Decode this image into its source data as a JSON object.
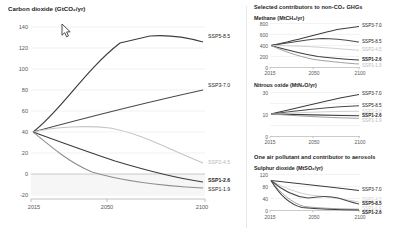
{
  "panels": {
    "main_title": "Carbon dioxide (GtCO₂/yr)",
    "right_header_1": "Selected contributors to non-CO₂ GHGs",
    "right_header_2": "One air pollutant and contributor to aerosols",
    "methane_title": "Methane (MtCH₄/yr)",
    "nitrous_title": "Nitrous oxide (MtN₂O/yr)",
    "sulphur_title": "Sulphur dioxide (MtSO₂/yr)"
  },
  "series_names": {
    "ssp5": "SSP5-8.5",
    "ssp3": "SSP3-7.0",
    "ssp2": "SSP2-4.5",
    "ssp126": "SSP1-2.6",
    "ssp119": "SSP1-1.9"
  },
  "colors": {
    "dark": "#3c3c3b",
    "mid": "#6f6f6e",
    "light": "#b9b9ba",
    "lighter": "#d2d2d3",
    "axis": "#9d9d9c",
    "grid": "#ebebeb",
    "text": "#1d1d1b",
    "tick_text": "#58585a",
    "band": "#f4f4f4"
  },
  "cursor": {
    "x": 61,
    "y": 23
  },
  "chart_data": [
    {
      "type": "line",
      "id": "carbon-dioxide",
      "title": "Carbon dioxide (GtCO₂/yr)",
      "xlabel": "",
      "ylabel": "GtCO₂/yr",
      "x": [
        2015,
        2030,
        2050,
        2070,
        2080,
        2090,
        2100
      ],
      "xlim": [
        2015,
        2100
      ],
      "ylim": [
        -20,
        145
      ],
      "xticks": [
        2015,
        2050,
        2100
      ],
      "yticks": [
        -20,
        0,
        20,
        40,
        60,
        80,
        100,
        120,
        140
      ],
      "grid": true,
      "legend": "right-inline",
      "series": [
        {
          "name": "SSP5-8.5",
          "values": [
            40,
            72,
            104,
            126,
            129,
            129,
            126
          ]
        },
        {
          "name": "SSP3-7.0",
          "values": [
            40,
            51,
            61,
            71,
            75,
            79,
            82
          ]
        },
        {
          "name": "SSP2-4.5",
          "values": [
            40,
            43,
            44,
            39,
            32,
            22,
            10
          ]
        },
        {
          "name": "SSP1-2.6",
          "values": [
            40,
            32,
            21,
            8,
            1,
            -6,
            -9
          ]
        },
        {
          "name": "SSP1-1.9",
          "values": [
            40,
            22,
            2,
            -6,
            -9,
            -12,
            -14
          ]
        }
      ]
    },
    {
      "type": "line",
      "id": "methane",
      "title": "Methane (MtCH₄/yr)",
      "x": [
        2015,
        2030,
        2050,
        2070,
        2085,
        2100
      ],
      "xlim": [
        2015,
        2100
      ],
      "ylim": [
        0,
        820
      ],
      "xticks": [
        2015,
        2050,
        2100
      ],
      "yticks": [
        0,
        200,
        400,
        600,
        800
      ],
      "grid": true,
      "series": [
        {
          "name": "SSP3-7.0",
          "values": [
            400,
            470,
            570,
            660,
            720,
            760
          ]
        },
        {
          "name": "SSP5-8.5",
          "values": [
            400,
            460,
            520,
            530,
            500,
            470
          ]
        },
        {
          "name": "SSP2-4.5",
          "values": [
            400,
            400,
            390,
            360,
            330,
            310
          ]
        },
        {
          "name": "SSP1-2.6",
          "values": [
            400,
            330,
            240,
            180,
            150,
            130
          ]
        },
        {
          "name": "SSP1-1.9",
          "values": [
            400,
            300,
            190,
            130,
            100,
            85
          ]
        }
      ]
    },
    {
      "type": "line",
      "id": "nitrous-oxide",
      "title": "Nitrous oxide (MtN₂O/yr)",
      "x": [
        2015,
        2030,
        2050,
        2070,
        2085,
        2100
      ],
      "xlim": [
        2015,
        2100
      ],
      "ylim": [
        0,
        33
      ],
      "xticks": [
        2015,
        2050,
        2100
      ],
      "yticks": [
        0,
        10,
        20,
        30
      ],
      "grid": true,
      "series": [
        {
          "name": "SSP3-7.0",
          "values": [
            10.5,
            13.5,
            17.5,
            21.5,
            24.5,
            27.0
          ]
        },
        {
          "name": "SSP5-8.5",
          "values": [
            10.5,
            12.0,
            13.5,
            14.5,
            15.3,
            16.0
          ]
        },
        {
          "name": "SSP2-4.5",
          "values": [
            10.5,
            11.3,
            12.0,
            12.2,
            12.2,
            12.0
          ]
        },
        {
          "name": "SSP1-2.6",
          "values": [
            10.5,
            10.3,
            9.8,
            9.4,
            9.2,
            9.0
          ]
        },
        {
          "name": "SSP1-1.9",
          "values": [
            10.5,
            10.0,
            9.2,
            8.6,
            8.2,
            8.0
          ]
        }
      ]
    },
    {
      "type": "line",
      "id": "sulphur-dioxide",
      "title": "Sulphur dioxide (MtSO₂/yr)",
      "x": [
        2015,
        2030,
        2050,
        2070,
        2085,
        2100
      ],
      "xlim": [
        2015,
        2100
      ],
      "ylim": [
        0,
        125
      ],
      "xticks": [
        2015,
        2050,
        2100
      ],
      "yticks": [
        0,
        40,
        80,
        120
      ],
      "grid": true,
      "series": [
        {
          "name": "SSP3-7.0",
          "values": [
            100,
            92,
            85,
            78,
            72,
            66
          ]
        },
        {
          "name": "SSP2-4.5",
          "values": [
            100,
            72,
            48,
            41,
            35,
            28
          ]
        },
        {
          "name": "SSP5-8.5",
          "values": [
            100,
            62,
            39,
            43,
            34,
            24
          ]
        },
        {
          "name": "SSP1-1.9",
          "values": [
            100,
            48,
            18,
            11,
            8,
            7
          ]
        },
        {
          "name": "SSP1-2.6",
          "values": [
            100,
            45,
            15,
            9,
            6,
            5
          ]
        }
      ]
    }
  ]
}
